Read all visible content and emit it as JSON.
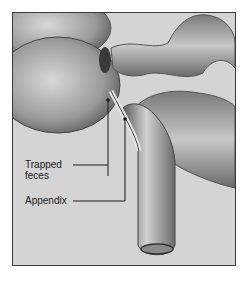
{
  "figure": {
    "labels": [
      {
        "id": "trapped-feces",
        "lines": [
          "Trapped",
          "feces"
        ]
      },
      {
        "id": "appendix",
        "text": "Appendix"
      }
    ],
    "colors": {
      "background": "#d4d4d4",
      "frame": "#3a3a3a",
      "tissue_light": "#c8c8c8",
      "tissue_dark": "#6a6a6a",
      "leader_line": "#1a1a1a"
    }
  }
}
